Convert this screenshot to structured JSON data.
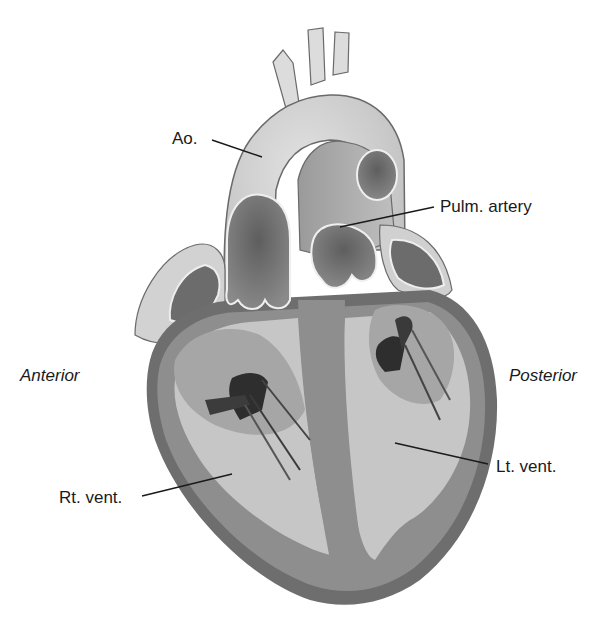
{
  "diagram": {
    "labels": {
      "aorta": "Ao.",
      "pulmonary_artery": "Pulm. artery",
      "anterior": "Anterior",
      "posterior": "Posterior",
      "right_ventricle": "Rt. vent.",
      "left_ventricle": "Lt. vent."
    },
    "colors": {
      "background": "#ffffff",
      "outer_wall": "#6e6e6e",
      "myocardium": "#8c8c8c",
      "chamber": "#c4c4c4",
      "vessel_light": "#d6d6d6",
      "vessel_dark": "#7a7a7a",
      "leaflet_dark": "#3a3a3a",
      "outline": "#5a5a5a",
      "leader_line": "#1a1a1a"
    }
  }
}
